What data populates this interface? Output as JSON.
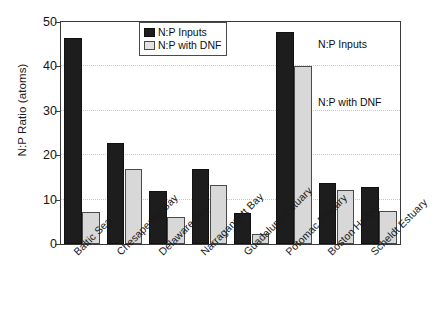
{
  "chart_data": {
    "type": "bar",
    "title": "",
    "xlabel": "",
    "ylabel": "N:P Ratio (atoms)",
    "ylim": [
      0,
      50
    ],
    "yticks": [
      0,
      10,
      20,
      30,
      40,
      50
    ],
    "grid": true,
    "legend_position": "top-center-inside",
    "categories": [
      "Baltic Sea",
      "Chesapeake Bay",
      "Delaware Bay",
      "Narragansett Bay",
      "Guadalupe Estuary",
      "Potomac Estuary",
      "Boston Harbor",
      "Scheldt Estuary"
    ],
    "series": [
      {
        "name": "N:P Inputs",
        "color": "#1d1d1d",
        "values": [
          46.5,
          22.8,
          11.9,
          16.8,
          7.0,
          47.8,
          13.8,
          12.8
        ]
      },
      {
        "name": "N:P with DNF",
        "color": "#d8d8d8",
        "values": [
          7.3,
          16.8,
          6.0,
          13.4,
          2.3,
          40.0,
          12.2,
          7.5
        ]
      }
    ],
    "annotations": [
      {
        "text": "N:P Inputs",
        "x_category": "Potomac Estuary",
        "value_y": 45
      },
      {
        "text": "N:P with DNF",
        "x_category": "Potomac Estuary",
        "value_y": 32
      }
    ]
  },
  "legend": {
    "items": [
      {
        "label": "N:P Inputs",
        "swatch": "dark"
      },
      {
        "label": "N:P with DNF",
        "swatch": "light"
      }
    ]
  },
  "axis": {
    "y_label": "N:P Ratio (atoms)",
    "y_ticks": [
      "0",
      "10",
      "20",
      "30",
      "40",
      "50"
    ]
  }
}
